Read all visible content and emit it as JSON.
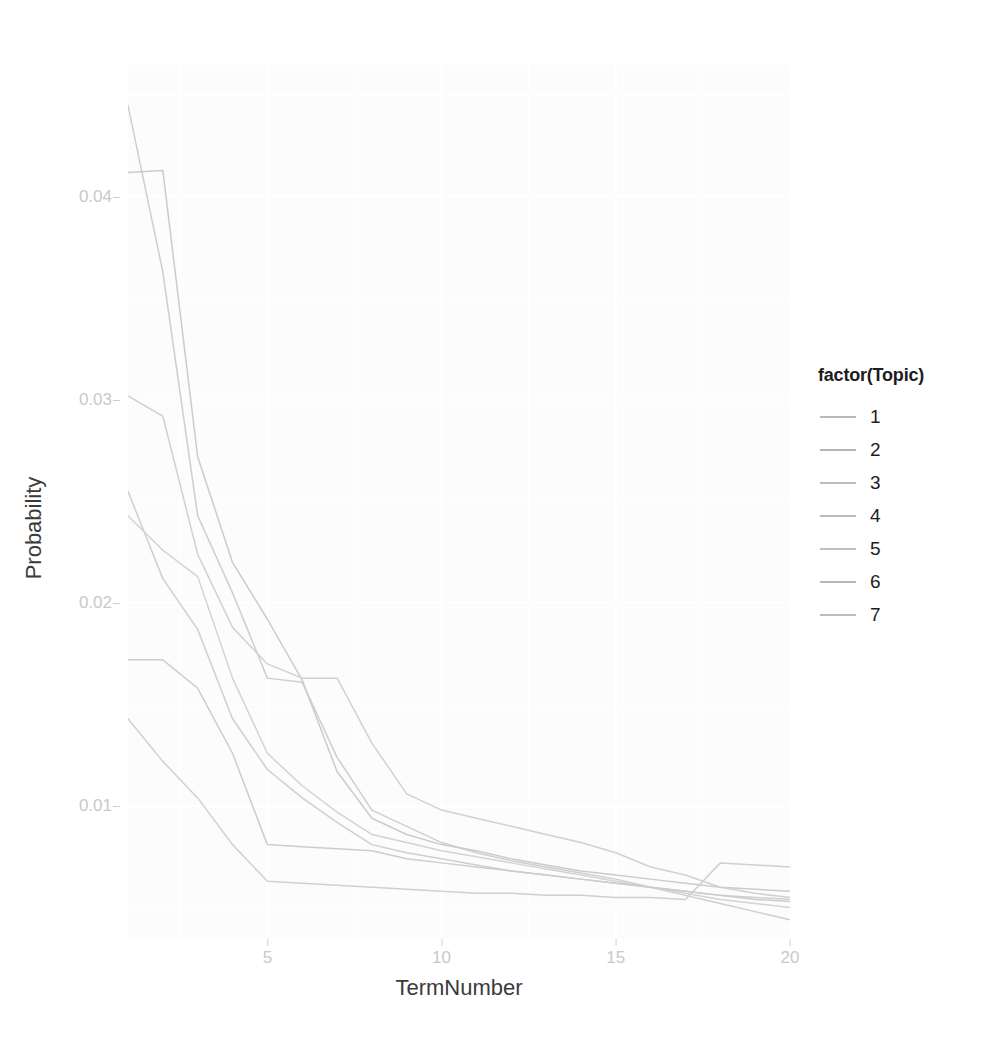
{
  "chart_data": {
    "type": "line",
    "title": "",
    "xlabel": "TermNumber",
    "ylabel": "Probability",
    "xlim": [
      1,
      20
    ],
    "ylim": [
      0.0035,
      0.0465
    ],
    "grid": true,
    "legend_position": "right",
    "legend_title": "factor(Topic)",
    "x": [
      1,
      2,
      3,
      4,
      5,
      6,
      7,
      8,
      9,
      10,
      11,
      12,
      13,
      14,
      15,
      16,
      17,
      18,
      19,
      20
    ],
    "xticks": [
      5,
      10,
      15,
      20
    ],
    "yticks": [
      0.01,
      0.02,
      0.03,
      0.04
    ],
    "ytick_labels": [
      "0.01",
      "0.02",
      "0.03",
      "0.04"
    ],
    "xtick_labels": [
      "5",
      "10",
      "15",
      "20"
    ],
    "series": [
      {
        "name": "1",
        "color": "#b9b9b9",
        "values": [
          0.0445,
          0.0363,
          0.0243,
          0.0205,
          0.0163,
          0.0161,
          0.0124,
          0.0098,
          0.009,
          0.0082,
          0.0077,
          0.0073,
          0.007,
          0.0067,
          0.0064,
          0.006,
          0.0056,
          0.0052,
          0.0048,
          0.0044
        ]
      },
      {
        "name": "2",
        "color": "#b5b5b5",
        "values": [
          0.0412,
          0.0413,
          0.0272,
          0.022,
          0.0192,
          0.0162,
          0.0117,
          0.0094,
          0.0086,
          0.0081,
          0.0078,
          0.0074,
          0.0071,
          0.0068,
          0.0066,
          0.0064,
          0.0062,
          0.006,
          0.0059,
          0.0058
        ]
      },
      {
        "name": "3",
        "color": "#bdbdbd",
        "values": [
          0.0302,
          0.0292,
          0.0224,
          0.0188,
          0.017,
          0.0163,
          0.0163,
          0.0131,
          0.0106,
          0.0098,
          0.0094,
          0.009,
          0.0086,
          0.0082,
          0.0077,
          0.007,
          0.0066,
          0.006,
          0.0057,
          0.0055
        ]
      },
      {
        "name": "4",
        "color": "#bababa",
        "values": [
          0.0255,
          0.0212,
          0.0187,
          0.0143,
          0.0118,
          0.0104,
          0.0092,
          0.0081,
          0.0077,
          0.0074,
          0.0071,
          0.0068,
          0.0066,
          0.0064,
          0.0062,
          0.006,
          0.0058,
          0.0056,
          0.0055,
          0.0054
        ]
      },
      {
        "name": "5",
        "color": "#c0c0c0",
        "values": [
          0.0243,
          0.0226,
          0.0213,
          0.0163,
          0.0126,
          0.011,
          0.0097,
          0.0086,
          0.0082,
          0.0078,
          0.0075,
          0.0072,
          0.0069,
          0.0066,
          0.0063,
          0.006,
          0.0057,
          0.0054,
          0.0052,
          0.005
        ]
      },
      {
        "name": "6",
        "color": "#b7b7b7",
        "values": [
          0.0172,
          0.0172,
          0.0158,
          0.0126,
          0.0081,
          0.008,
          0.0079,
          0.0078,
          0.0074,
          0.0072,
          0.007,
          0.0068,
          0.0066,
          0.0064,
          0.0062,
          0.006,
          0.0058,
          0.0056,
          0.0054,
          0.0053
        ]
      },
      {
        "name": "7",
        "color": "#bcbcbc",
        "values": [
          0.0143,
          0.0122,
          0.0104,
          0.0081,
          0.0063,
          0.0062,
          0.0061,
          0.006,
          0.0059,
          0.0058,
          0.0057,
          0.0057,
          0.0056,
          0.0056,
          0.0055,
          0.0055,
          0.0054,
          0.0072,
          0.0071,
          0.007
        ]
      }
    ],
    "colors": {
      "panel_background": "#fbfbfb",
      "grid_major": "#ffffff",
      "grid_minor": "#ffffff",
      "axis_text": "#c9c9c9",
      "axis_title": "#3a3a3a",
      "legend_text": "#1d1d1d"
    }
  }
}
